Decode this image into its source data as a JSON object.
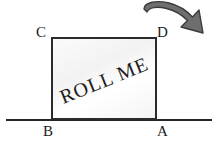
{
  "figure": {
    "block_label": "ROLL ME",
    "corners": {
      "top_left": "C",
      "top_right": "D",
      "bottom_left": "B",
      "bottom_right": "A"
    },
    "arrow": {
      "name": "curved-clockwise-arrow",
      "direction": "clockwise",
      "color": "#6e6e6e",
      "outline_color": "#3c3c3c"
    },
    "ground": {
      "name": "ground-line",
      "color": "#262626"
    },
    "colors": {
      "block_outline": "#2b2b2b",
      "block_fill": "#f7f7f7",
      "text": "#1a1a1a"
    }
  }
}
